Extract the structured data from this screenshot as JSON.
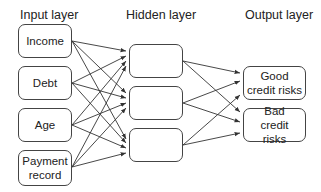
{
  "headers": {
    "input": "Input layer",
    "hidden": "Hidden layer",
    "output": "Output layer"
  },
  "input_nodes": [
    "Income",
    "Debt",
    "Age",
    "Payment record"
  ],
  "hidden_nodes": [
    "",
    "",
    ""
  ],
  "output_nodes": [
    "Good credit risks",
    "Bad credit risks"
  ],
  "colors": {
    "line": "#333333",
    "border": "#444444",
    "text": "#222222"
  }
}
